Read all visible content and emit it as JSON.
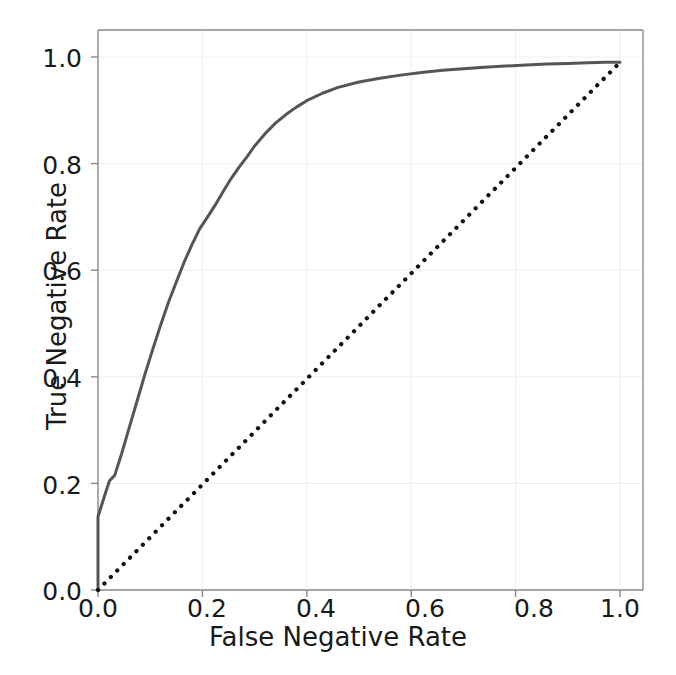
{
  "chart_data": {
    "type": "line",
    "title": "",
    "subtitle": "",
    "xlabel": "False Negative Rate",
    "ylabel": "True Negative Rate",
    "xlim": [
      -0.05,
      1.05
    ],
    "ylim": [
      -0.05,
      1.05
    ],
    "grid": true,
    "legend": null,
    "xticks": [
      "0.0",
      "0.2",
      "0.4",
      "0.6",
      "0.8",
      "1.0"
    ],
    "xtick_values": [
      0.0,
      0.2,
      0.4,
      0.6,
      0.8,
      1.0
    ],
    "yticks": [
      "0.0",
      "0.2",
      "0.4",
      "0.6",
      "0.8",
      "1.0"
    ],
    "ytick_values": [
      0.0,
      0.2,
      0.4,
      0.6,
      0.8,
      1.0
    ],
    "series": [
      {
        "name": "roc-curve",
        "style": "solid",
        "color": "#555555",
        "linewidth": 3.0,
        "x": [
          0.0,
          0.0,
          0.004,
          0.012,
          0.022,
          0.032,
          0.045,
          0.06,
          0.075,
          0.09,
          0.105,
          0.12,
          0.135,
          0.15,
          0.165,
          0.18,
          0.195,
          0.21,
          0.225,
          0.24,
          0.255,
          0.27,
          0.285,
          0.3,
          0.32,
          0.34,
          0.36,
          0.38,
          0.4,
          0.43,
          0.46,
          0.5,
          0.54,
          0.58,
          0.62,
          0.66,
          0.7,
          0.74,
          0.78,
          0.82,
          0.86,
          0.9,
          0.94,
          0.97,
          1.0
        ],
        "y": [
          0.0,
          0.138,
          0.15,
          0.175,
          0.205,
          0.215,
          0.255,
          0.305,
          0.355,
          0.405,
          0.452,
          0.497,
          0.54,
          0.578,
          0.615,
          0.648,
          0.678,
          0.7,
          0.723,
          0.748,
          0.772,
          0.793,
          0.812,
          0.833,
          0.856,
          0.876,
          0.892,
          0.906,
          0.918,
          0.932,
          0.943,
          0.953,
          0.96,
          0.966,
          0.971,
          0.975,
          0.978,
          0.981,
          0.983,
          0.985,
          0.987,
          0.988,
          0.989,
          0.99,
          0.99
        ]
      },
      {
        "name": "chance-diagonal",
        "style": "dotted",
        "color": "#101010",
        "linewidth": 3.0,
        "x": [
          0.0,
          1.0
        ],
        "y": [
          0.0,
          0.99
        ]
      }
    ],
    "colors": {
      "curve": "#555555",
      "diagonal": "#101010",
      "grid": "#f0f0f0",
      "spine": "#777777",
      "text": "#1a1a1a",
      "background": "#ffffff"
    }
  },
  "axes": {
    "x_label": "False Negative Rate",
    "y_label": "True Negative Rate"
  }
}
